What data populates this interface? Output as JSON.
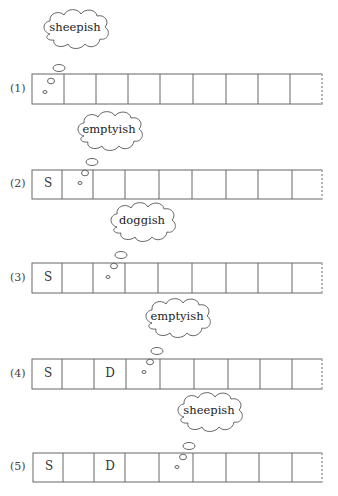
{
  "diagram": {
    "cell_count": 9,
    "rows": [
      {
        "label": "(1)",
        "cells": [
          "",
          "",
          "",
          "",
          "",
          "",
          "",
          "",
          ""
        ],
        "thought": "sheepish",
        "thought_cell": 0
      },
      {
        "label": "(2)",
        "cells": [
          "S",
          "",
          "",
          "",
          "",
          "",
          "",
          "",
          ""
        ],
        "thought": "emptyish",
        "thought_cell": 1
      },
      {
        "label": "(3)",
        "cells": [
          "S",
          "",
          "",
          "",
          "",
          "",
          "",
          "",
          ""
        ],
        "thought": "doggish",
        "thought_cell": 2
      },
      {
        "label": "(4)",
        "cells": [
          "S",
          "",
          "D",
          "",
          "",
          "",
          "",
          "",
          ""
        ],
        "thought": "emptyish",
        "thought_cell": 3
      },
      {
        "label": "(5)",
        "cells": [
          "S",
          "",
          "D",
          "",
          "",
          "",
          "",
          "",
          ""
        ],
        "thought": "sheepish",
        "thought_cell": 4
      }
    ]
  }
}
